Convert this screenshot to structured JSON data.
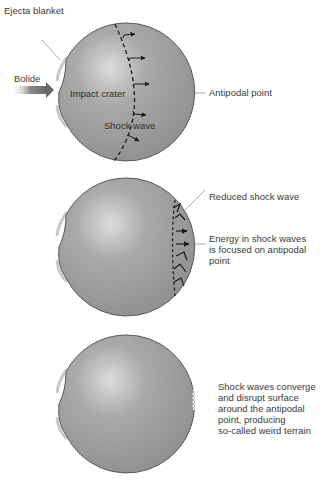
{
  "panels": [
    {
      "id": "impact",
      "labels": {
        "ejecta": "Ejecta blanket",
        "bolide": "Bolide",
        "crater": "Impact crater",
        "shock": "Shock wave",
        "antipodal": "Antipodal point"
      }
    },
    {
      "id": "propagation",
      "labels": {
        "reduced": "Reduced shock wave",
        "energy": "Energy in shock waves\nis focused on antipodal\npoint"
      }
    },
    {
      "id": "convergence",
      "labels": {
        "converge": "Shock waves converge\nand disrupt surface\naround the antipodal\npoint, producing\nso-called weird terrain"
      }
    }
  ],
  "colors": {
    "sphere_fill": "#9a9a9a",
    "sphere_highlight": "#d8d8d8",
    "sphere_edge": "#555555",
    "shock_line": "#1a1a1a",
    "leader_line": "#888888",
    "bolide_arrow": "#7a7a7a"
  }
}
